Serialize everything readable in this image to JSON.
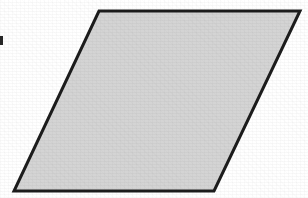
{
  "figure": {
    "name": "parallelogram",
    "canvas": {
      "width": 308,
      "height": 198,
      "background_color": "#ffffff"
    },
    "shape": {
      "kind": "parallelogram",
      "fill_color": "#d4d4d4",
      "stroke_color": "#1c1c1c",
      "stroke_width": 3,
      "points": "99,11 300,11 214,191 14,191",
      "vertices": [
        {
          "label": "top-left",
          "x": 99,
          "y": 11
        },
        {
          "label": "top-right",
          "x": 300,
          "y": 11
        },
        {
          "label": "bottom-right",
          "x": 214,
          "y": 191
        },
        {
          "label": "bottom-left",
          "x": 14,
          "y": 191
        }
      ]
    },
    "marks": [
      {
        "name": "left-edge-mark",
        "x": 0,
        "y": 36,
        "width": 3,
        "height": 9,
        "color": "#262626"
      }
    ]
  }
}
